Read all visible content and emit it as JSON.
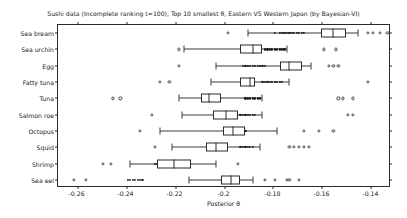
{
  "chart_data": {
    "type": "box",
    "title": "Sushi data (Incomplete ranking t=100), Top 10 smallest θ, Eastern VS Western Japan (by Bayesian-VI)",
    "xlabel": "Posterior θ",
    "ylabel": "",
    "xlim": [
      -0.268,
      -0.132
    ],
    "xticks": [
      -0.26,
      -0.24,
      -0.22,
      -0.2,
      -0.18,
      -0.16,
      -0.14
    ],
    "xticklabels": [
      "-0.26",
      "-0.24",
      "-0.22",
      "-0.2",
      "-0.18",
      "-0.16",
      "-0.14"
    ],
    "grid": false,
    "legend": null,
    "orientation": "horizontal",
    "categories": [
      "Sea bream",
      "Sea urchin",
      "Egg",
      "Fatty tuna",
      "Tuna",
      "Salmon roe",
      "Octopus",
      "Squid",
      "Shrimp",
      "Sea eel"
    ],
    "boxes": [
      {
        "category": "Sea bream",
        "q1": -0.1605,
        "median": -0.1555,
        "q3": -0.1505,
        "whisker_low": -0.1905,
        "whisker_high": -0.1455,
        "outliers_low": [
          -0.1985
        ],
        "outliers_high": [
          -0.1415,
          -0.1395,
          -0.1365,
          -0.1335
        ],
        "dense_cluster": [
          -0.1795,
          -0.1775,
          -0.1765,
          -0.1755,
          -0.1745,
          -0.1735,
          -0.1725,
          -0.1715,
          -0.1705,
          -0.1695,
          -0.1685,
          -0.1675
        ]
      },
      {
        "category": "Sea urchin",
        "q1": -0.1935,
        "median": -0.1885,
        "q3": -0.1845,
        "whisker_low": -0.2165,
        "whisker_high": -0.1745,
        "outliers_low": [
          -0.2185
        ],
        "outliers_high": [
          -0.1595,
          -0.1545
        ],
        "dense_cluster": [
          -0.1835,
          -0.1825,
          -0.1815,
          -0.1805,
          -0.1795,
          -0.1785,
          -0.1775,
          -0.1765,
          -0.1755
        ]
      },
      {
        "category": "Egg",
        "q1": -0.1775,
        "median": -0.1735,
        "q3": -0.1685,
        "whisker_low": -0.2035,
        "whisker_high": -0.1645,
        "outliers_low": [
          -0.2185
        ],
        "outliers_high": [
          -0.1575,
          -0.1555,
          -0.1535
        ],
        "dense_cluster": [
          -0.1925,
          -0.1915,
          -0.1905,
          -0.1895,
          -0.1885,
          -0.1875,
          -0.1865,
          -0.1855,
          -0.1845,
          -0.1835
        ]
      },
      {
        "category": "Fatty tuna",
        "q1": -0.1935,
        "median": -0.1895,
        "q3": -0.1875,
        "whisker_low": -0.2055,
        "whisker_high": -0.1735,
        "outliers_low": [
          -0.2225,
          -0.2265
        ],
        "outliers_high": [
          -0.1415
        ],
        "dense_cluster": [
          -0.1845,
          -0.1835,
          -0.1825,
          -0.1815,
          -0.1805,
          -0.1795,
          -0.1785,
          -0.1775,
          -0.1765
        ]
      },
      {
        "category": "Tuna",
        "q1": -0.2095,
        "median": -0.2065,
        "q3": -0.2015,
        "whisker_low": -0.2185,
        "whisker_high": -0.1845,
        "outliers_low": [
          -0.2455,
          -0.2425
        ],
        "outliers_high": [
          -0.1535,
          -0.1515,
          -0.1475
        ],
        "dense_cluster": [
          -0.1915,
          -0.1905,
          -0.1895,
          -0.1885,
          -0.1875,
          -0.1865,
          -0.1855
        ]
      },
      {
        "category": "Salmon roe",
        "q1": -0.2045,
        "median": -0.1995,
        "q3": -0.1945,
        "whisker_low": -0.2175,
        "whisker_high": -0.1845,
        "outliers_low": [
          -0.2295
        ],
        "outliers_high": [
          -0.1495,
          -0.1475
        ],
        "dense_cluster": [
          -0.1935,
          -0.1925,
          -0.1915,
          -0.1905,
          -0.1895,
          -0.1885,
          -0.1875
        ]
      },
      {
        "category": "Octopus",
        "q1": -0.2005,
        "median": -0.1965,
        "q3": -0.1915,
        "whisker_low": -0.2265,
        "whisker_high": -0.1785,
        "outliers_low": [
          -0.2345
        ],
        "outliers_high": [
          -0.1675,
          -0.1615,
          -0.1555
        ],
        "dense_cluster": [
          -0.1975,
          -0.1965,
          -0.1955,
          -0.1945,
          -0.1935,
          -0.1925,
          -0.1915
        ]
      },
      {
        "category": "Squid",
        "q1": -0.2075,
        "median": -0.2035,
        "q3": -0.1985,
        "whisker_low": -0.2215,
        "whisker_high": -0.1855,
        "outliers_low": [
          -0.2285
        ],
        "outliers_high": [
          -0.1735,
          -0.1715,
          -0.1695,
          -0.1675,
          -0.1655
        ],
        "dense_cluster": [
          -0.1935,
          -0.1925,
          -0.1915,
          -0.1905,
          -0.1895,
          -0.1885
        ]
      },
      {
        "category": "Shrimp",
        "q1": -0.2275,
        "median": -0.2205,
        "q3": -0.2135,
        "whisker_low": -0.2385,
        "whisker_high": -0.2035,
        "outliers_low": [
          -0.2495,
          -0.2465
        ],
        "outliers_high": [
          -0.1945
        ],
        "dense_cluster": [
          -0.2285,
          -0.2275,
          -0.2265,
          -0.2255,
          -0.2245,
          -0.2235
        ]
      },
      {
        "category": "Sea eel",
        "q1": -0.2015,
        "median": -0.1975,
        "q3": -0.1935,
        "whisker_low": -0.2145,
        "whisker_high": -0.1885,
        "outliers_low": [
          -0.2615,
          -0.2565
        ],
        "outliers_high": [
          -0.1835,
          -0.1795,
          -0.1745,
          -0.1735,
          -0.1695
        ],
        "dense_cluster": [
          -0.2395,
          -0.2385,
          -0.2375,
          -0.2365,
          -0.2355,
          -0.2345,
          -0.2335
        ]
      }
    ]
  },
  "colors": {
    "background": "#ffffff",
    "axis": "#2b2b2b",
    "box_edge": "#2b2b2b",
    "whisker": "#3a3a3a",
    "point": "#4a4a4a",
    "dense_point": "#111111",
    "text": "#1a1a1a"
  }
}
